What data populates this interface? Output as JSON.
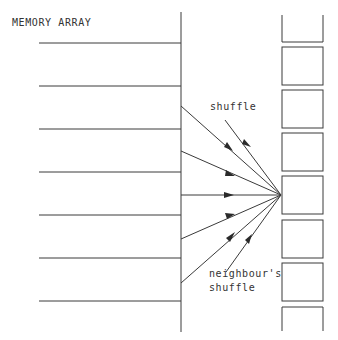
{
  "title": "MEMORY ARRAY",
  "labels": {
    "shuffle": "shuffle",
    "neighbour_line1": "neighbour's",
    "neighbour_line2": "shuffle"
  },
  "colors": {
    "stroke": "#3a3a3a",
    "background": "#ffffff"
  },
  "memory_rows": 7,
  "processor_cells": 8
}
